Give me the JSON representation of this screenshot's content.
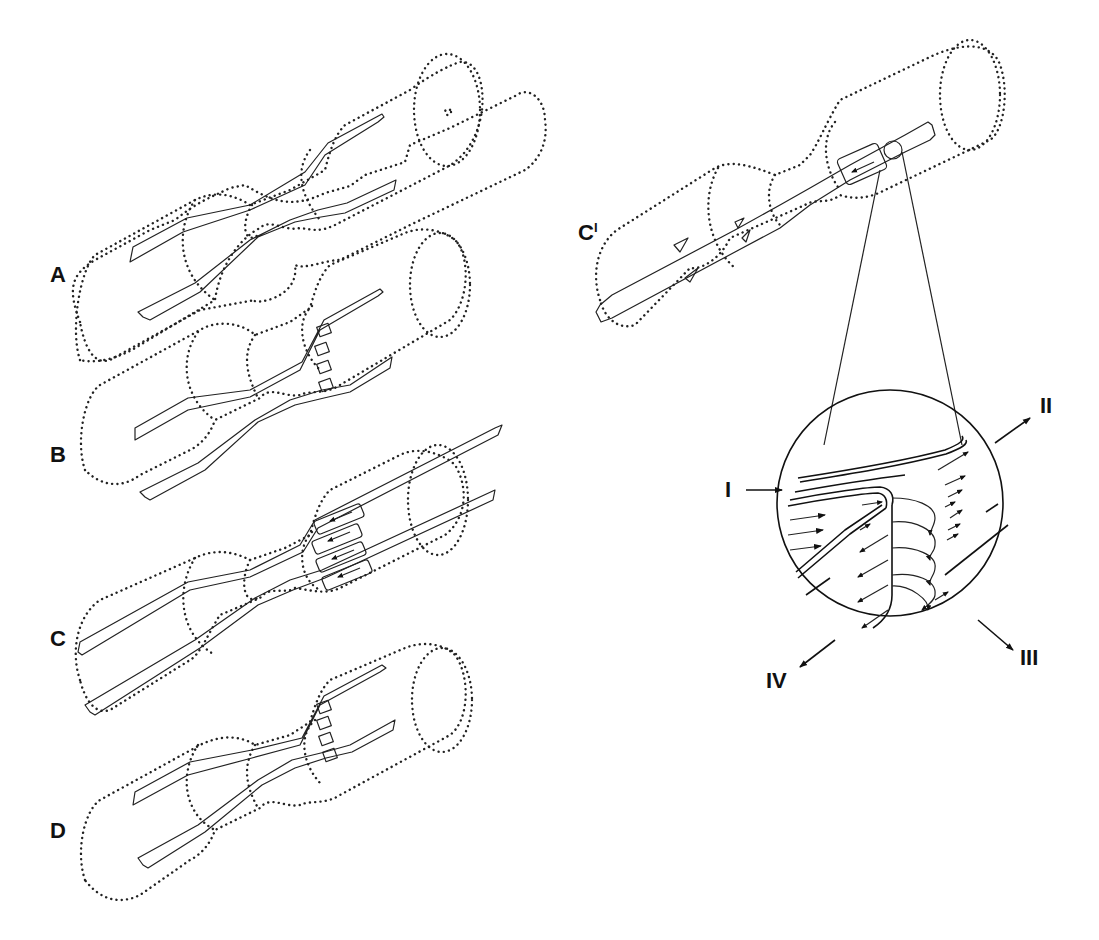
{
  "figure": {
    "panels": [
      {
        "id": "A",
        "label": "A",
        "description": "Dotted constricted tube with two strands crossing at the waist, no sheet segments"
      },
      {
        "id": "B",
        "label": "B",
        "description": "Same as A with small sheet segments appearing at the right cone"
      },
      {
        "id": "C",
        "label": "C",
        "description": "Elongated strands with larger sheet segments with arrows at the right cone"
      },
      {
        "id": "D",
        "label": "D",
        "description": "Same as B, sheet segments reduced"
      },
      {
        "id": "Cprime",
        "label": "C",
        "label_superscript": "I",
        "description": "Single strand through tube with sheet and magnification circle"
      }
    ],
    "inset": {
      "description": "Magnified circle showing flow arrows",
      "direction_labels": [
        {
          "id": "I",
          "label": "I"
        },
        {
          "id": "II",
          "label": "II"
        },
        {
          "id": "III",
          "label": "III"
        },
        {
          "id": "IV",
          "label": "IV"
        }
      ]
    }
  }
}
